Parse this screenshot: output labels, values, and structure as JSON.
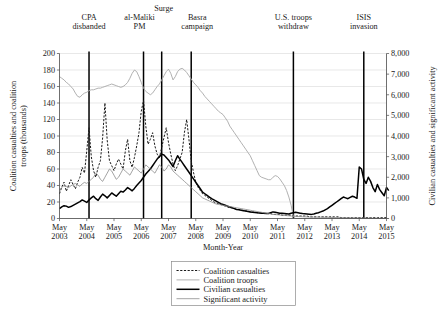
{
  "chart_data": {
    "type": "line",
    "title": "",
    "xlabel": "Month-Year",
    "ylabel_left": "Coalition casualties and coalition troops (thousands)",
    "ylabel_right": "Civilian casualties and significant activity",
    "grid": true,
    "legend_position": "bottom-center",
    "ylim_left": [
      0,
      200
    ],
    "ylim_right": [
      0,
      8000
    ],
    "ytick_labels_left": [
      "0",
      "20",
      "40",
      "60",
      "80",
      "100",
      "120",
      "140",
      "160",
      "180",
      "200"
    ],
    "ytick_values_left": [
      0,
      20,
      40,
      60,
      80,
      100,
      120,
      140,
      160,
      180,
      200
    ],
    "ytick_labels_right": [
      "0",
      "1,000",
      "2,000",
      "3,000",
      "4,000",
      "5,000",
      "6,000",
      "7,000",
      "8,000"
    ],
    "ytick_values_right": [
      0,
      1000,
      2000,
      3000,
      4000,
      5000,
      6000,
      7000,
      8000
    ],
    "xtick_labels": [
      [
        "May",
        "2003"
      ],
      [
        "May",
        "2004"
      ],
      [
        "May",
        "2005"
      ],
      [
        "May",
        "2006"
      ],
      [
        "May",
        "2007"
      ],
      [
        "May",
        "2008"
      ],
      [
        "May",
        "2009"
      ],
      [
        "May",
        "2010"
      ],
      [
        "May",
        "2011"
      ],
      [
        "May",
        "2012"
      ],
      [
        "May",
        "2013"
      ],
      [
        "May",
        "2014"
      ],
      [
        "May",
        "2015"
      ]
    ],
    "xlim_months": [
      0,
      144
    ],
    "annotations": [
      {
        "label": "CPA disbanded",
        "lines": [
          "CPA",
          "disbanded"
        ],
        "month": 13
      },
      {
        "label": "al-Maliki PM",
        "lines": [
          "al-Maliki",
          "PM"
        ],
        "month": 37
      },
      {
        "label": "Surge",
        "lines": [
          "Surge"
        ],
        "month": 45
      },
      {
        "label": "Basra campaign",
        "lines": [
          "Basra",
          "campaign"
        ],
        "month": 58
      },
      {
        "label": "U.S. troops withdraw",
        "lines": [
          "U.S. troops",
          "withdraw"
        ],
        "month": 103
      },
      {
        "label": "ISIS invasion",
        "lines": [
          "ISIS",
          "invasion"
        ],
        "month": 134
      }
    ],
    "series": [
      {
        "name": "Coalition casualties",
        "style": "dashed",
        "color": "#1a1a1a",
        "axis": "left",
        "values": [
          30,
          38,
          44,
          33,
          40,
          47,
          41,
          36,
          44,
          50,
          62,
          55,
          82,
          110,
          75,
          58,
          50,
          62,
          70,
          98,
          140,
          95,
          70,
          64,
          58,
          66,
          72,
          66,
          60,
          82,
          96,
          70,
          62,
          74,
          88,
          104,
          130,
          143,
          112,
          90,
          96,
          104,
          88,
          78,
          74,
          86,
          98,
          110,
          92,
          78,
          66,
          58,
          64,
          72,
          80,
          104,
          120,
          96,
          70,
          56,
          44,
          38,
          34,
          30,
          28,
          26,
          24,
          22,
          20,
          19,
          18,
          17,
          16,
          15,
          14,
          13,
          13,
          12,
          11,
          11,
          10,
          10,
          9,
          9,
          8,
          8,
          8,
          7,
          7,
          7,
          6,
          6,
          6,
          6,
          5,
          5,
          5,
          5,
          4,
          4,
          4,
          4,
          4,
          3,
          3,
          3,
          3,
          3,
          3,
          3,
          2,
          2,
          2,
          2,
          2,
          2,
          2,
          2,
          2,
          2,
          2,
          2,
          2,
          2,
          1,
          1,
          1,
          1,
          1,
          1,
          1,
          1,
          1,
          1,
          1,
          1,
          1,
          1,
          1,
          1,
          1,
          1,
          1,
          1,
          1
        ]
      },
      {
        "name": "Coalition troops",
        "style": "light-solid",
        "color": "#a8a8a8",
        "axis": "left",
        "values": [
          172,
          170,
          168,
          165,
          163,
          160,
          157,
          152,
          148,
          147,
          150,
          152,
          153,
          155,
          156,
          156,
          157,
          158,
          158,
          159,
          160,
          161,
          162,
          163,
          162,
          161,
          160,
          159,
          160,
          162,
          165,
          170,
          176,
          180,
          178,
          172,
          165,
          158,
          154,
          152,
          150,
          152,
          156,
          160,
          163,
          168,
          173,
          178,
          181,
          176,
          168,
          172,
          178,
          181,
          182,
          180,
          177,
          173,
          169,
          165,
          162,
          159,
          155,
          152,
          148,
          145,
          142,
          139,
          136,
          133,
          130,
          128,
          126,
          122,
          118,
          112,
          108,
          104,
          100,
          96,
          92,
          88,
          84,
          80,
          76,
          70,
          64,
          58,
          52,
          50,
          49,
          48,
          47,
          47,
          50,
          52,
          51,
          48,
          44,
          40,
          34,
          26,
          16,
          2,
          0,
          0,
          0,
          0,
          0,
          0,
          0,
          0,
          0,
          0,
          0,
          0,
          0,
          0,
          0,
          0,
          0,
          0,
          0,
          0,
          0,
          0,
          0,
          0,
          0,
          0,
          0,
          0,
          0,
          0,
          0,
          0,
          0,
          0,
          0,
          0,
          0,
          0,
          0,
          0,
          0,
          0
        ]
      },
      {
        "name": "Civilian casualties",
        "style": "bold-solid",
        "color": "#000000",
        "axis": "right",
        "values": [
          480,
          560,
          620,
          600,
          540,
          580,
          640,
          700,
          760,
          820,
          900,
          840,
          780,
          900,
          1000,
          1080,
          960,
          880,
          1040,
          1180,
          1100,
          1000,
          1120,
          1240,
          1160,
          1080,
          1200,
          1320,
          1280,
          1380,
          1500,
          1420,
          1340,
          1460,
          1600,
          1720,
          1840,
          2000,
          2160,
          2280,
          2400,
          2560,
          2720,
          2880,
          3000,
          3120,
          3080,
          2960,
          2840,
          2680,
          2520,
          2800,
          3040,
          2880,
          2720,
          2560,
          2400,
          2240,
          2080,
          1920,
          1760,
          1600,
          1440,
          1280,
          1200,
          1120,
          1040,
          960,
          900,
          840,
          780,
          720,
          680,
          640,
          600,
          560,
          520,
          480,
          440,
          420,
          400,
          380,
          360,
          340,
          320,
          300,
          290,
          280,
          270,
          260,
          250,
          240,
          240,
          280,
          320,
          300,
          280,
          260,
          250,
          240,
          230,
          220,
          250,
          280,
          300,
          280,
          260,
          240,
          230,
          220,
          210,
          200,
          220,
          250,
          280,
          320,
          360,
          420,
          480,
          560,
          640,
          720,
          800,
          880,
          960,
          1040,
          1000,
          960,
          1020,
          1080,
          1040,
          980,
          2500,
          2400,
          1900,
          1700,
          2000,
          1800,
          1500,
          1300,
          1650,
          1400,
          1250,
          1100,
          1500,
          1350
        ]
      },
      {
        "name": "Significant activity",
        "style": "thin-solid",
        "color": "#8c8c8c",
        "axis": "right",
        "values": [
          1400,
          1500,
          1600,
          1550,
          1500,
          1580,
          1650,
          1700,
          1620,
          1560,
          1680,
          1750,
          1700,
          1800,
          1900,
          2000,
          2200,
          2100,
          1900,
          1800,
          2000,
          2200,
          2400,
          2300,
          2100,
          1900,
          2000,
          2200,
          2400,
          2300,
          2200,
          2100,
          2300,
          2500,
          2400,
          2300,
          2200,
          2400,
          2600,
          2500,
          2400,
          2300,
          2200,
          2400,
          2600,
          2500,
          2300,
          2400,
          2600,
          2500,
          2300,
          2200,
          2100,
          2000,
          1900,
          1800,
          1700,
          1600,
          1500,
          1400,
          1300,
          1200,
          1100,
          1000,
          950,
          900,
          850,
          800,
          750,
          700,
          680,
          660,
          640,
          620,
          600,
          580,
          560,
          540,
          520,
          500,
          480,
          460,
          440,
          420,
          400,
          380,
          360,
          340,
          320,
          300,
          280,
          260,
          240,
          220,
          200,
          190,
          180,
          170,
          160,
          150,
          140,
          130,
          120,
          110,
          100,
          95,
          90,
          85,
          80,
          75,
          70,
          68,
          66,
          64,
          62,
          60,
          58,
          56,
          54,
          52,
          50,
          48,
          46,
          44,
          42,
          40,
          38,
          36,
          34,
          32,
          30,
          28,
          26,
          24,
          22,
          20,
          18,
          16,
          14,
          12,
          10,
          8,
          6,
          4,
          2
        ]
      }
    ]
  },
  "legend": {
    "entries": [
      {
        "label": "Coalition casualties",
        "style": "dashed"
      },
      {
        "label": "Coalition troops",
        "style": "light-solid"
      },
      {
        "label": "Civilian casualties",
        "style": "bold-solid"
      },
      {
        "label": "Significant activity",
        "style": "thin-solid"
      }
    ]
  },
  "colors": {
    "coalition_casualties": "#1a1a1a",
    "coalition_troops": "#a8a8a8",
    "civilian_casualties": "#000000",
    "significant_activity": "#8c8c8c",
    "event_line": "#000000",
    "gridline": "#d9d9d9",
    "axis": "#4a4a4a",
    "background": "#ffffff"
  }
}
